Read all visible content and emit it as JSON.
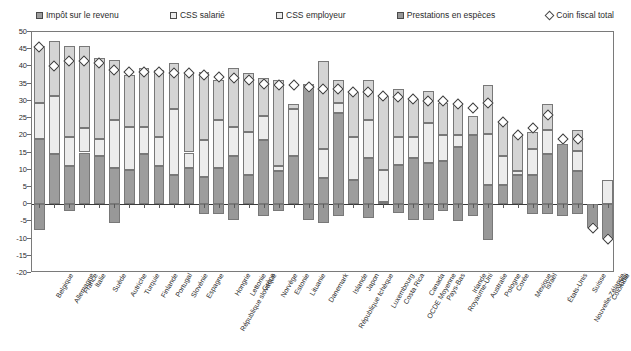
{
  "legend": {
    "items": [
      {
        "label": "Impôt sur le revenu",
        "marker": "square-swatch-icon",
        "color": "#9d9d9d"
      },
      {
        "label": "CSS salarié",
        "marker": "square-swatch-icon",
        "color": "#ececec"
      },
      {
        "label": "CSS employeur",
        "marker": "square-swatch-icon",
        "color": "#d4d4d4"
      },
      {
        "label": "Prestations en espèces",
        "marker": "square-swatch-icon",
        "color": "#989898"
      },
      {
        "label": "Coin fiscal total",
        "marker": "diamond-marker-icon",
        "color": "#ffffff"
      }
    ]
  },
  "axis": {
    "y_ticks": [
      "50",
      "45",
      "40",
      "35",
      "30",
      "25",
      "20",
      "15",
      "10",
      "5",
      "0",
      "-5",
      "-10",
      "-15",
      "-20"
    ],
    "y_tick_values": [
      50,
      45,
      40,
      35,
      30,
      25,
      20,
      15,
      10,
      5,
      0,
      -5,
      -10,
      -15,
      -20
    ]
  },
  "chart_data": {
    "type": "bar",
    "stacked": true,
    "title": "",
    "subtitle": "",
    "xlabel": "",
    "ylabel": "",
    "ylim": [
      -20,
      50
    ],
    "ytick_step": 5,
    "grid": false,
    "legend_position": "top",
    "categories": [
      "Belgique",
      "Allemagne",
      "France",
      "Italie",
      "Suède",
      "Autriche",
      "Turquie",
      "Finlande",
      "Portugal",
      "Slovénie",
      "Espagne",
      "République slovaque",
      "Hongrie",
      "Lettonie",
      "Grèce",
      "Norvège",
      "Estonie",
      "Lituanie",
      "Danemark",
      "République tchèque",
      "Islande",
      "Japon",
      "Luxembourg",
      "Costa Rica",
      "OCDE Moyenne",
      "Canada",
      "Pays-Bas",
      "Royaume-Uni",
      "Irlande",
      "Australie",
      "Pologne",
      "Corée",
      "Mexique",
      "Israël",
      "États-Unis",
      "Nouvelle-Zélande",
      "Suisse",
      "Colombie",
      "Chili"
    ],
    "series": [
      {
        "name": "Impôt sur le revenu",
        "key": "income_tax",
        "color": "#9d9d9d",
        "values": [
          19.0,
          14.5,
          11.0,
          15.0,
          14.0,
          10.5,
          10.0,
          14.5,
          11.0,
          8.5,
          10.5,
          8.0,
          10.5,
          14.0,
          8.5,
          18.5,
          9.5,
          14.0,
          34.5,
          7.5,
          26.5,
          7.0,
          13.5,
          0.5,
          11.5,
          13.5,
          12.0,
          12.5,
          16.5,
          20.0,
          5.5,
          5.5,
          8.5,
          8.5,
          14.5,
          17.5,
          9.5,
          0.0,
          0.0
        ]
      },
      {
        "name": "CSS salarié",
        "key": "employee_ssc",
        "color": "#ececec",
        "values": [
          10.5,
          17.0,
          8.5,
          7.0,
          5.0,
          14.0,
          12.5,
          8.0,
          8.5,
          19.0,
          4.5,
          10.5,
          14.0,
          8.5,
          12.5,
          7.0,
          1.5,
          13.5,
          0.0,
          8.5,
          3.0,
          12.5,
          11.0,
          9.5,
          8.0,
          6.0,
          11.5,
          7.5,
          3.5,
          0.0,
          15.0,
          8.5,
          1.0,
          7.5,
          7.0,
          0.0,
          6.0,
          0.0,
          7.0
        ]
      },
      {
        "name": "CSS employeur",
        "key": "employer_ssc",
        "color": "#d4d4d4",
        "values": [
          16.5,
          16.0,
          26.5,
          24.0,
          23.5,
          17.5,
          15.0,
          17.0,
          19.5,
          13.5,
          23.0,
          20.0,
          11.5,
          17.0,
          17.0,
          11.0,
          25.0,
          1.5,
          0.5,
          25.5,
          6.5,
          13.0,
          11.5,
          21.5,
          14.0,
          11.0,
          9.5,
          9.5,
          9.5,
          5.5,
          14.0,
          9.5,
          10.5,
          5.0,
          7.5,
          0.0,
          6.0,
          0.0,
          0.0
        ]
      },
      {
        "name": "Prestations en espèces",
        "key": "cash_benefits",
        "color": "#989898",
        "values": [
          -7.5,
          0.0,
          -2.0,
          0.0,
          0.0,
          -5.5,
          0.0,
          0.0,
          0.0,
          0.0,
          0.0,
          -3.0,
          -3.0,
          -4.5,
          0.0,
          -3.5,
          -2.0,
          0.0,
          -4.5,
          -5.5,
          -3.5,
          0.0,
          -4.0,
          0.0,
          -2.5,
          -4.5,
          -4.5,
          -2.0,
          -5.0,
          -3.5,
          -10.5,
          0.0,
          0.0,
          -3.0,
          -3.0,
          -3.5,
          -3.0,
          -7.0,
          -10.0
        ]
      }
    ],
    "marker_series": {
      "name": "Coin fiscal total",
      "key": "total_tax_wedge",
      "marker": "diamond",
      "values": [
        45.5,
        40.0,
        41.5,
        41.5,
        41.0,
        39.0,
        38.5,
        38.5,
        38.5,
        38.0,
        38.0,
        37.5,
        37.0,
        36.5,
        36.0,
        35.0,
        34.5,
        34.5,
        34.0,
        33.5,
        33.5,
        32.5,
        32.5,
        31.5,
        31.0,
        30.5,
        30.0,
        30.0,
        29.0,
        28.0,
        29.5,
        24.0,
        20.0,
        22.0,
        26.0,
        19.0,
        19.0,
        -7.0,
        -10.0
      ]
    }
  }
}
